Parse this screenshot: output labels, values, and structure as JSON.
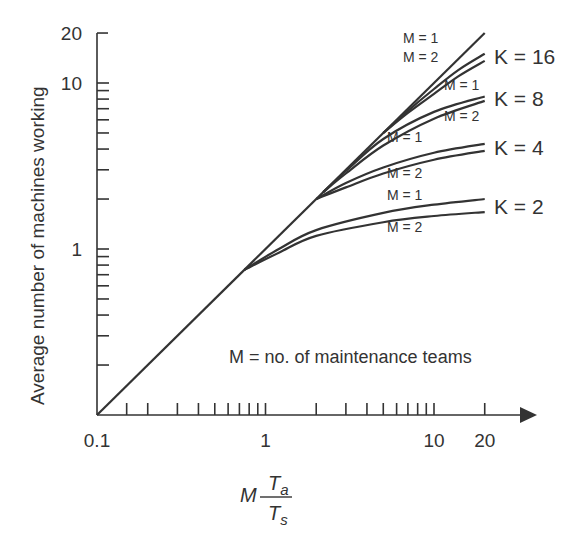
{
  "chart_data": {
    "type": "line",
    "title": "",
    "xlabel": "M·Ta/Ts",
    "xlabel_parts": {
      "coef": "M",
      "num": "T",
      "num_sub": "a",
      "den": "T",
      "den_sub": "s"
    },
    "ylabel": "Average number of machines working",
    "xscale": "log",
    "yscale": "log",
    "xlim": [
      0.1,
      20
    ],
    "ylim": [
      0.1,
      20
    ],
    "x_tick_labels": [
      "0.1",
      "1",
      "10",
      "20"
    ],
    "y_tick_labels": [
      "1",
      "10",
      "20"
    ],
    "annotation": "M = no. of maintenance teams",
    "grid": false,
    "series": [
      {
        "name": "Diagonal (y = x)",
        "x": [
          0.1,
          20
        ],
        "y": [
          0.1,
          20
        ]
      },
      {
        "name": "K=16, M=1",
        "K": 16,
        "M": 1,
        "x": [
          5,
          7,
          10,
          14,
          20
        ],
        "y": [
          5,
          6.8,
          9.2,
          12.0,
          15.0
        ]
      },
      {
        "name": "K=16, M=2",
        "K": 16,
        "M": 2,
        "x": [
          5,
          7,
          10,
          14,
          20
        ],
        "y": [
          5,
          6.6,
          8.6,
          11.0,
          13.6
        ]
      },
      {
        "name": "K=8, M=1",
        "K": 8,
        "M": 1,
        "x": [
          2.2,
          3,
          5,
          10,
          20
        ],
        "y": [
          2.2,
          2.95,
          4.6,
          6.7,
          8.3
        ]
      },
      {
        "name": "K=8, M=2",
        "K": 8,
        "M": 2,
        "x": [
          2.2,
          3,
          5,
          10,
          20
        ],
        "y": [
          2.2,
          2.85,
          4.2,
          6.1,
          7.8
        ]
      },
      {
        "name": "K=4, M=1",
        "K": 4,
        "M": 1,
        "x": [
          2,
          3,
          5,
          10,
          20
        ],
        "y": [
          2,
          2.5,
          3.1,
          3.8,
          4.3
        ]
      },
      {
        "name": "K=4, M=2",
        "K": 4,
        "M": 2,
        "x": [
          2,
          3,
          5,
          10,
          20
        ],
        "y": [
          2,
          2.35,
          2.85,
          3.45,
          3.9
        ]
      },
      {
        "name": "K=2, M=1",
        "K": 2,
        "M": 1,
        "x": [
          0.75,
          1.2,
          2,
          5,
          10,
          20
        ],
        "y": [
          0.75,
          1.0,
          1.3,
          1.65,
          1.85,
          2.0
        ]
      },
      {
        "name": "K=2, M=2",
        "K": 2,
        "M": 2,
        "x": [
          0.75,
          1.2,
          2,
          5,
          10,
          20
        ],
        "y": [
          0.75,
          0.95,
          1.2,
          1.45,
          1.58,
          1.67
        ]
      }
    ],
    "labels": {
      "k16": "K = 16",
      "k8": "K = 8",
      "k4": "K = 4",
      "k2": "K = 2",
      "m1": "M = 1",
      "m2": "M = 2"
    }
  }
}
